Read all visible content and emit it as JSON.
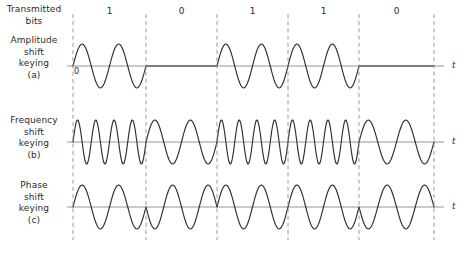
{
  "figure": {
    "width": 471,
    "height": 254,
    "background": "#ffffff",
    "wave_color": "#2f2f2f",
    "baseline_color": "#8a8a8a",
    "divider_color": "#8f8f8f",
    "text_color": "#2b2b2b"
  },
  "labels": {
    "transmitted_bits": [
      "Transmitted",
      "bits"
    ],
    "ask": [
      "Amplitude",
      "shift",
      "keying",
      "(a)"
    ],
    "fsk": [
      "Frequency",
      "shift",
      "keying",
      "(b)"
    ],
    "psk": [
      "Phase",
      "shift",
      "keying",
      "(c)"
    ],
    "zero_marker": "0",
    "time_axis": "t"
  },
  "chart_data": {
    "type": "line",
    "title": "",
    "xlabel": "t",
    "ylabel": "",
    "grid": false,
    "legend": "none",
    "bits": [
      1,
      0,
      1,
      1,
      0
    ],
    "bit_labels": [
      "1",
      "0",
      "1",
      "1",
      "0"
    ],
    "bit_boundaries_px": [
      73,
      146,
      217,
      288,
      359,
      434
    ],
    "plot_left_px": 73,
    "plot_right_px": 434,
    "signals": [
      {
        "name": "Amplitude shift keying",
        "key": "ask",
        "panel": "a",
        "baseline_y_px": 66,
        "amplitude_px": 22,
        "cycles_for_one": 2,
        "cycles_for_zero": 0,
        "amplitude_for_one": 1,
        "amplitude_for_zero": 0,
        "phase_inversion": false
      },
      {
        "name": "Frequency shift keying",
        "key": "fsk",
        "panel": "b",
        "baseline_y_px": 142,
        "amplitude_px": 22,
        "cycles_for_one": 4,
        "cycles_for_zero": 2,
        "amplitude_for_one": 1,
        "amplitude_for_zero": 1,
        "phase_inversion": false
      },
      {
        "name": "Phase shift keying",
        "key": "psk",
        "panel": "c",
        "baseline_y_px": 207,
        "amplitude_px": 22,
        "cycles_for_one": 2,
        "cycles_for_zero": 2,
        "amplitude_for_one": 1,
        "amplitude_for_zero": 1,
        "phase_inversion": true
      }
    ],
    "axis_label_x_px": 452,
    "bit_label_y_px": 6
  }
}
